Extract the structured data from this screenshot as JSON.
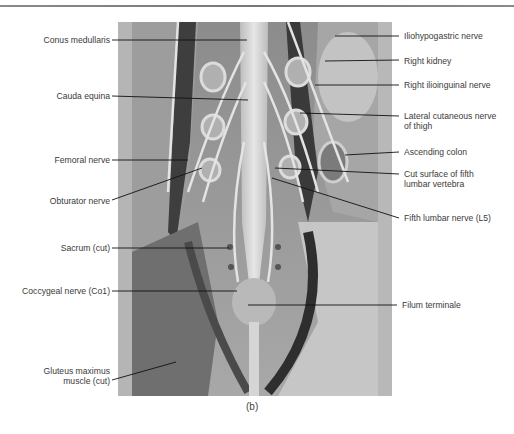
{
  "figure": {
    "caption": "(b)",
    "labels_left": [
      {
        "id": "conus",
        "text": "Conus medullaris"
      },
      {
        "id": "cauda",
        "text": "Cauda equina"
      },
      {
        "id": "femoral",
        "text": "Femoral nerve"
      },
      {
        "id": "obturator",
        "text": "Obturator nerve"
      },
      {
        "id": "sacrum",
        "text": "Sacrum (cut)"
      },
      {
        "id": "coccygeal",
        "text": "Coccygeal nerve (Co1)"
      },
      {
        "id": "gluteus1",
        "text": "Gluteus maximus"
      },
      {
        "id": "gluteus2",
        "text": "muscle (cut)"
      }
    ],
    "labels_right": [
      {
        "id": "iliohypo",
        "text": "Iliohypogastric nerve"
      },
      {
        "id": "kidney",
        "text": "Right kidney"
      },
      {
        "id": "ilioinguinal",
        "text": "Right ilioinguinal nerve"
      },
      {
        "id": "lateral1",
        "text": "Lateral cutaneous nerve"
      },
      {
        "id": "lateral2",
        "text": "of thigh"
      },
      {
        "id": "colon",
        "text": "Ascending colon"
      },
      {
        "id": "cut1",
        "text": "Cut surface of fifth"
      },
      {
        "id": "cut2",
        "text": "lumbar vertebra"
      },
      {
        "id": "l5",
        "text": "Fifth lumbar nerve (L5)"
      },
      {
        "id": "filum",
        "text": "Filum terminale"
      }
    ]
  }
}
